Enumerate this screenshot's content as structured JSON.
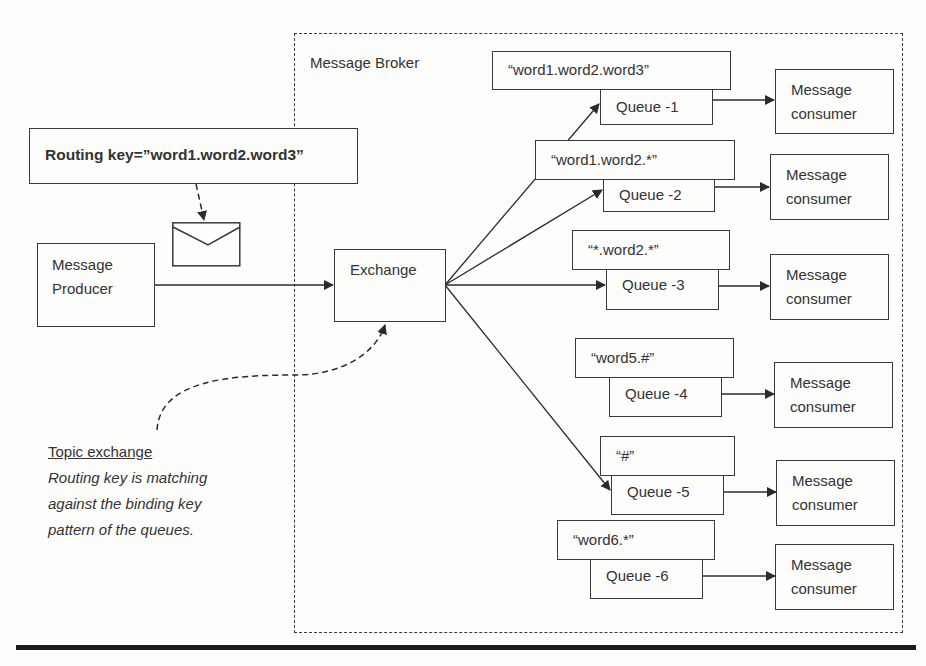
{
  "broker": {
    "label": "Message Broker"
  },
  "routing_key": {
    "label": "Routing key=”word1.word2.word3”"
  },
  "producer": {
    "line1": "Message",
    "line2": "Producer"
  },
  "exchange": {
    "label": "Exchange"
  },
  "note": {
    "title": "Topic exchange",
    "lines": [
      "Routing key is matching",
      "against the binding key",
      "pattern of the queues."
    ]
  },
  "bindings": [
    {
      "pattern": "“word1.word2.word3”",
      "queue": "Queue -1"
    },
    {
      "pattern": "“word1.word2.*”",
      "queue": "Queue -2"
    },
    {
      "pattern": "“*.word2.*”",
      "queue": "Queue -3"
    },
    {
      "pattern": "“word5.#”",
      "queue": "Queue -4"
    },
    {
      "pattern": "“#”",
      "queue": "Queue -5"
    },
    {
      "pattern": "“word6.*”",
      "queue": "Queue -6"
    }
  ],
  "consumers": [
    {
      "line1": "Message",
      "line2": "consumer"
    },
    {
      "line1": "Message",
      "line2": "consumer"
    },
    {
      "line1": "Message",
      "line2": "consumer"
    },
    {
      "line1": "Message",
      "line2": "consumer"
    },
    {
      "line1": "Message",
      "line2": "consumer"
    },
    {
      "line1": "Message",
      "line2": "consumer"
    }
  ],
  "icons": {
    "message": "envelope-icon"
  }
}
